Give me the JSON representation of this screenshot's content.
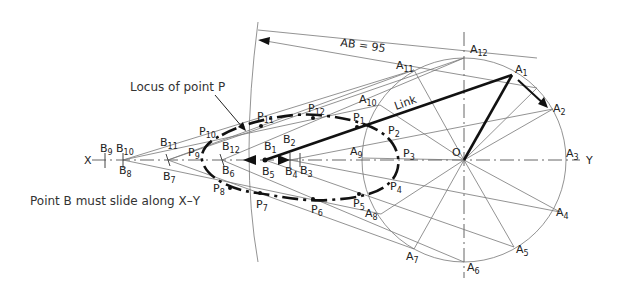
{
  "annotations": {
    "locus_label": "Locus of point P",
    "slide_note": "Point B must slide along X–Y",
    "dimension": "AB = 95",
    "link_label": "Link"
  },
  "axis": {
    "left": "X",
    "right": "Y"
  },
  "crank_center": "O",
  "labels": {
    "A": [
      "A",
      "1",
      "2",
      "3",
      "4",
      "5",
      "6",
      "7",
      "8",
      "9",
      "10",
      "11",
      "12"
    ],
    "B": [
      "B",
      "1",
      "2",
      "3",
      "4",
      "5",
      "6",
      "7",
      "8",
      "9",
      "10",
      "11",
      "12"
    ],
    "P": [
      "P",
      "1",
      "2",
      "3",
      "4",
      "5",
      "6",
      "7",
      "8",
      "9",
      "10",
      "11",
      "12"
    ]
  },
  "geometry": {
    "O": [
      464,
      160
    ],
    "crank_radius": 102,
    "AB_length_mm": 95
  }
}
